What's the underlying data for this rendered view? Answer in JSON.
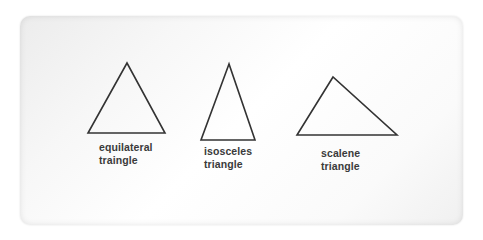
{
  "diagram": {
    "background": "#ffffff",
    "stroke_color": "#333333",
    "triangles": [
      {
        "name": "equilateral",
        "points": "127,63 88,133 165,133",
        "label_line1": "equilateral",
        "label_line2": "traingle"
      },
      {
        "name": "isosceles",
        "points": "229,64 201,140 255,140",
        "label_line1": "isosceles",
        "label_line2": "triangle"
      },
      {
        "name": "scalene",
        "points": "333,77 297,135 397,135",
        "label_line1": "scalene",
        "label_line2": "triangle"
      }
    ]
  }
}
